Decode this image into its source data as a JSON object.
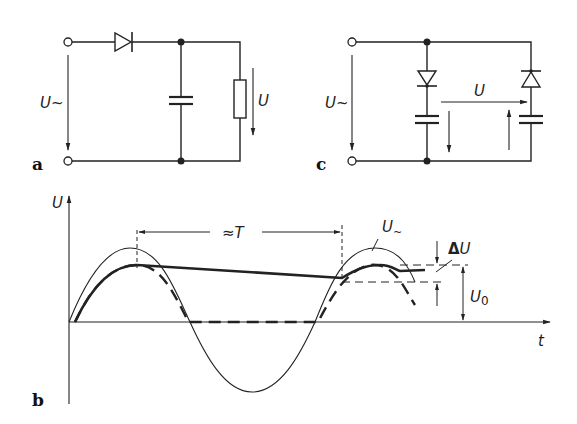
{
  "figure": {
    "panels": {
      "a": {
        "label": "a",
        "input_voltage": "U~",
        "output_voltage": "U",
        "components": [
          "diode",
          "capacitor",
          "resistor"
        ]
      },
      "c": {
        "label": "c",
        "input_voltage": "U~",
        "output_voltage": "U",
        "components": [
          "diode",
          "capacitor",
          "diode",
          "capacitor"
        ]
      },
      "b": {
        "label": "b",
        "y_axis": "U",
        "x_axis": "t",
        "period_label": "≈T",
        "source_label": "U~",
        "ripple_label": "ΔU",
        "dc_label": "U0",
        "dc_label_main": "U",
        "dc_label_sub": "0",
        "ripple_label_delta": "Δ",
        "ripple_label_u": "U",
        "source_label_u": "U",
        "source_label_tilde": "~"
      }
    }
  }
}
